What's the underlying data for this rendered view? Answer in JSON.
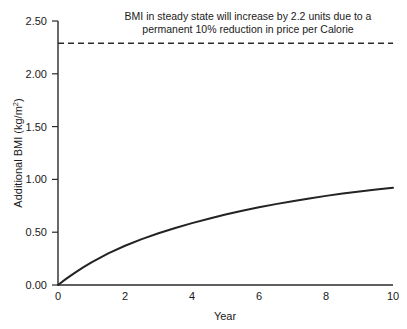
{
  "chart_data": {
    "type": "line",
    "title": "BMI in steady state will increase by 2.2 units due to a permanent 10% reduction in price per Calorie",
    "title_line1": "BMI in steady state will increase by 2.2 units due to a",
    "title_line2": "permanent 10% reduction in price per Calorie",
    "xlabel": "Year",
    "ylabel": "Additional BMI (kg/m²)",
    "xlim": [
      0,
      10
    ],
    "ylim": [
      0,
      2.5
    ],
    "grid": false,
    "legend": "none",
    "xticks": [
      0,
      2,
      4,
      6,
      8,
      10
    ],
    "xtick_labels": [
      "0",
      "2",
      "4",
      "6",
      "8",
      "10"
    ],
    "yticks": [
      0.0,
      0.5,
      1.0,
      1.5,
      2.0,
      2.5
    ],
    "ytick_labels": [
      "0.00",
      "0.50",
      "1.00",
      "1.50",
      "2.00",
      "2.50"
    ],
    "series": [
      {
        "name": "Additional BMI transition path",
        "style": "solid",
        "x": [
          0,
          0.25,
          0.5,
          0.75,
          1,
          1.5,
          2,
          2.5,
          3,
          3.5,
          4,
          4.5,
          5,
          5.5,
          6,
          6.5,
          7,
          7.5,
          8,
          8.5,
          9,
          9.5,
          10
        ],
        "values": [
          0.0,
          0.06,
          0.115,
          0.167,
          0.215,
          0.3,
          0.372,
          0.434,
          0.49,
          0.54,
          0.586,
          0.628,
          0.667,
          0.703,
          0.736,
          0.766,
          0.794,
          0.82,
          0.844,
          0.866,
          0.886,
          0.905,
          0.92
        ]
      },
      {
        "name": "Steady state BMI increase",
        "style": "dashed",
        "x": [
          0,
          10
        ],
        "values": [
          2.29,
          2.29
        ]
      },
      {
        "name": "Baseline",
        "style": "solid",
        "x": [
          0,
          10
        ],
        "values": [
          0.0,
          0.0
        ]
      }
    ],
    "annotations": [
      {
        "text": "2.2 units steady state increase",
        "value": 2.2
      }
    ]
  }
}
